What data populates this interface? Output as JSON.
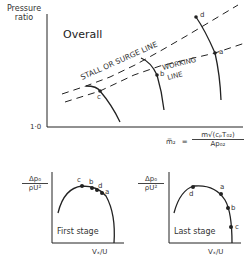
{
  "overall": {
    "title": "Overall",
    "y_axis_label_line1": "Pressure",
    "y_axis_label_line2": "ratio",
    "y_axis_origin": "1·0",
    "stall_line_label": "STALL OR SURGE LINE",
    "working_line_label_line1": "WORKING",
    "working_line_label_line2": "LINE",
    "points": [
      "a",
      "b",
      "c",
      "d"
    ],
    "x_axis_formula": {
      "lhs": "m̅₂",
      "equals": "=",
      "numerator": "m√(cₚT₀₂)",
      "denominator": "Ap₀₂"
    }
  },
  "first_stage": {
    "title": "First stage",
    "y_label_num": "Δp₀",
    "y_label_den": "ρU²",
    "x_label": "Vₓ/U",
    "points": [
      "c",
      "b",
      "d",
      "a"
    ]
  },
  "last_stage": {
    "title": "Last stage",
    "y_label_num": "Δp₀",
    "y_label_den": "ρU²",
    "x_label": "Vₓ/U",
    "points": [
      "d",
      "a",
      "b",
      "c"
    ]
  },
  "colors": {
    "ink": "#222222",
    "background": "#ffffff"
  }
}
